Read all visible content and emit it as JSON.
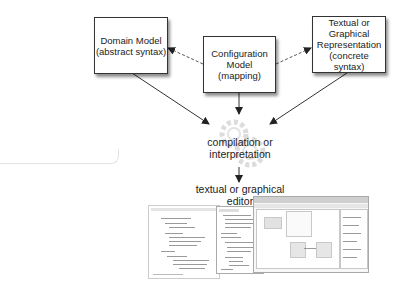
{
  "diagram": {
    "nodes": {
      "domain_model": {
        "lines": [
          "Domain Model",
          "(abstract syntax)"
        ]
      },
      "configuration_model": {
        "lines": [
          "Configuration",
          "Model",
          "(mapping)"
        ]
      },
      "representation": {
        "lines": [
          "Textual or",
          "Graphical",
          "Representation",
          "(concrete syntax)"
        ]
      }
    },
    "process": {
      "lines": [
        "compilation or",
        "interpretation"
      ],
      "icon": "gears-icon"
    },
    "output": {
      "lines": [
        "textual or graphical",
        "editor"
      ]
    },
    "edges": [
      {
        "from": "configuration_model",
        "to": "domain_model",
        "style": "dashed"
      },
      {
        "from": "configuration_model",
        "to": "representation",
        "style": "dashed"
      },
      {
        "from": "domain_model",
        "to": "process",
        "style": "solid"
      },
      {
        "from": "configuration_model",
        "to": "process",
        "style": "solid"
      },
      {
        "from": "representation",
        "to": "process",
        "style": "solid"
      },
      {
        "from": "process",
        "to": "output",
        "style": "solid"
      }
    ],
    "colors": {
      "line": "#333333",
      "box_border": "#333333",
      "gear": "#d8d8d8"
    }
  }
}
